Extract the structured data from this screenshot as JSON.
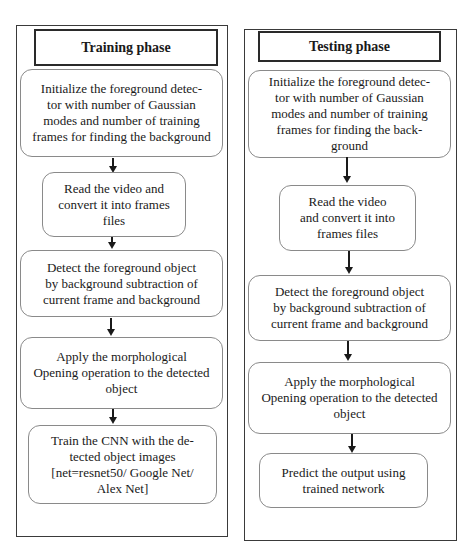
{
  "training": {
    "title": "Training phase",
    "steps": [
      {
        "text": "Initialize the foreground detec-\ntor with number of Gaussian\nmodes and number of training\nframes for finding the background"
      },
      {
        "text": "Read the video and\nconvert it into frames\nfiles"
      },
      {
        "text": "Detect the foreground object\nby background subtraction of\ncurrent frame and background"
      },
      {
        "text": "Apply the morphological\nOpening operation to the detected\nobject"
      },
      {
        "text": "Train the CNN with the de-\ntected object images\n[net=resnet50/ Google Net/\nAlex Net]"
      }
    ]
  },
  "testing": {
    "title": "Testing phase",
    "steps": [
      {
        "text": "Initialize the foreground detec-\ntor with number of Gaussian\nmodes and number of training\nframes for finding the back-\nground"
      },
      {
        "text": "Read the video\nand convert it into\nframes files"
      },
      {
        "text": "Detect the foreground object\nby background subtraction of\ncurrent frame and background"
      },
      {
        "text": "Apply the morphological\nOpening operation to the detected\nobject"
      },
      {
        "text": "Predict the output using\ntrained network"
      }
    ]
  }
}
